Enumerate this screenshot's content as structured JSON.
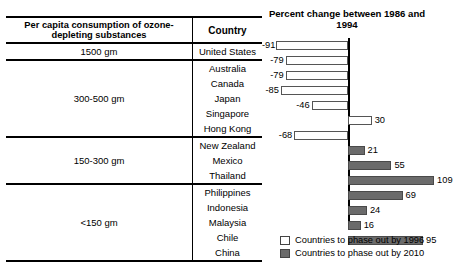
{
  "table": {
    "headers": {
      "consumption": "Per capita consumption of ozone-depleting substances",
      "country": "Country"
    },
    "groups": [
      {
        "label": "1500 gm",
        "countries": [
          "United States"
        ]
      },
      {
        "label": "300-500 gm",
        "countries": [
          "Australia",
          "Canada",
          "Japan",
          "Singapore",
          "Hong Kong"
        ]
      },
      {
        "label": "150-300 gm",
        "countries": [
          "New Zealand",
          "Mexico",
          "Thailand"
        ]
      },
      {
        "label": "<150 gm",
        "countries": [
          "Philippines",
          "Indonesia",
          "Malaysia",
          "Chile",
          "China"
        ]
      }
    ]
  },
  "legend": {
    "items": [
      {
        "swatch": "open",
        "label": "Countries to phase out by 1996"
      },
      {
        "swatch": "fill",
        "label": "Countries to phase out by 2010"
      }
    ]
  },
  "chart_data": {
    "type": "bar",
    "orientation": "horizontal",
    "title": "Percent change between 1986 and 1994",
    "xlabel": "",
    "ylabel": "",
    "xlim": [
      -95,
      115
    ],
    "grid": false,
    "legend_position": "bottom-right",
    "zero_axis": true,
    "categories": [
      "United States",
      "Australia",
      "Canada",
      "Japan",
      "Singapore",
      "Hong Kong",
      "New Zealand",
      "Mexico",
      "Thailand",
      "Philippines",
      "Indonesia",
      "Malaysia",
      "Chile",
      "China"
    ],
    "values": [
      -91,
      -79,
      -79,
      -85,
      -46,
      30,
      -68,
      21,
      55,
      109,
      69,
      24,
      16,
      95
    ],
    "labels": [
      "-91",
      "-79",
      "-79",
      "-85",
      "-46",
      "30",
      "-68",
      "21",
      "55",
      "109",
      "69",
      "24",
      "16",
      "95"
    ],
    "series": [
      {
        "name": "Countries to phase out by 1996",
        "style": "open",
        "points": [
          {
            "category": "United States",
            "value": -91
          },
          {
            "category": "Australia",
            "value": -79
          },
          {
            "category": "Canada",
            "value": -79
          },
          {
            "category": "Japan",
            "value": -85
          },
          {
            "category": "Singapore",
            "value": -46
          },
          {
            "category": "Hong Kong",
            "value": 30
          },
          {
            "category": "New Zealand",
            "value": -68
          }
        ]
      },
      {
        "name": "Countries to phase out by 2010",
        "style": "fill",
        "points": [
          {
            "category": "Mexico",
            "value": 21
          },
          {
            "category": "Thailand",
            "value": 55
          },
          {
            "category": "Philippines",
            "value": 109
          },
          {
            "category": "Indonesia",
            "value": 69
          },
          {
            "category": "Malaysia",
            "value": 24
          },
          {
            "category": "Chile",
            "value": 16
          },
          {
            "category": "China",
            "value": 95
          }
        ]
      }
    ],
    "colors": {
      "open": "#ffffff",
      "fill": "#6b6b6b",
      "outline": "#555555",
      "axis": "#000000"
    }
  }
}
